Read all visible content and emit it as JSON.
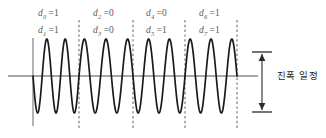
{
  "figure": {
    "kind": "phase-shift-keying-waveform",
    "caption_right": "진폭 일정",
    "axis": {
      "baseline_y": 76,
      "vertical_axis_x": 33,
      "color": "#808080"
    },
    "segment_boundaries_x": [
      79,
      133,
      185,
      237
    ],
    "colors": {
      "wave": "#1a1a1a",
      "axis": "#8a8a8a",
      "dashed": "#6e6e6e",
      "label_text": "#5a5a5a",
      "caption_text": "#1d1d1d",
      "arrow": "#2b2b2b"
    },
    "amplitude_marker": {
      "label": "진폭 일정",
      "x": 262,
      "top_y": 52,
      "bottom_y": 112
    }
  },
  "bit_labels": [
    {
      "top": {
        "symbol": "d",
        "index": "0",
        "eq": "=",
        "value": "1"
      },
      "bottom": {
        "symbol": "d",
        "index": "1",
        "eq": "=",
        "value": "1"
      },
      "x": 38
    },
    {
      "top": {
        "symbol": "d",
        "index": "2",
        "eq": "=",
        "value": "0"
      },
      "bottom": {
        "symbol": "d",
        "index": "3",
        "eq": "=",
        "value": "0"
      },
      "x": 93
    },
    {
      "top": {
        "symbol": "d",
        "index": "4",
        "eq": "=",
        "value": "0"
      },
      "bottom": {
        "symbol": "d",
        "index": "5",
        "eq": "=",
        "value": "1"
      },
      "x": 146
    },
    {
      "top": {
        "symbol": "d",
        "index": "6",
        "eq": "=",
        "value": "1"
      },
      "bottom": {
        "symbol": "d",
        "index": "7",
        "eq": "=",
        "value": "1"
      },
      "x": 199
    }
  ],
  "label_rows": {
    "top_y": 8,
    "bottom_y": 25
  },
  "chart_data": {
    "type": "line",
    "title": "",
    "xlabel": "",
    "ylabel": "",
    "amplitude": 37,
    "baseline_y": 76,
    "x_start": 33,
    "x_end": 237,
    "segments": [
      {
        "bits": [
          "1",
          "1"
        ],
        "x0": 33,
        "x1": 79,
        "cycles": 2.5,
        "phase_deg": 180
      },
      {
        "bits": [
          "0",
          "0"
        ],
        "x0": 79,
        "x1": 133,
        "cycles": 2.5,
        "phase_deg": 0
      },
      {
        "bits": [
          "0",
          "1"
        ],
        "x0": 133,
        "x1": 185,
        "cycles": 2.5,
        "phase_deg": 180
      },
      {
        "bits": [
          "1",
          "1"
        ],
        "x0": 185,
        "x1": 237,
        "cycles": 2.5,
        "phase_deg": 0
      }
    ],
    "annotations": [
      "진폭 일정"
    ],
    "grid": false,
    "legend": "none"
  }
}
